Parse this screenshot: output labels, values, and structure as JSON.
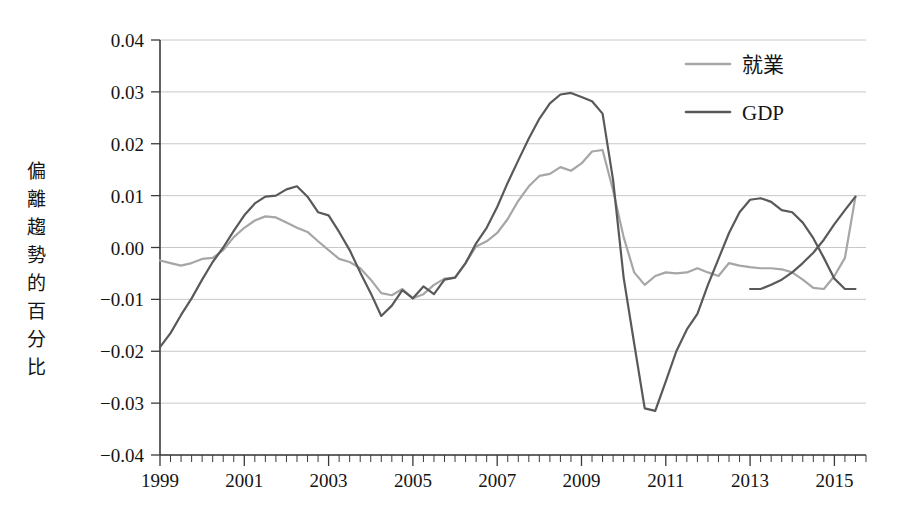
{
  "chart_data": {
    "type": "line",
    "title": "",
    "subtitle": "",
    "xlabel": "",
    "ylabel": "偏離趨勢的百分比",
    "ylabel_chars": [
      "偏",
      "離",
      "趨",
      "勢",
      "的",
      "百",
      "分",
      "比"
    ],
    "xlim": [
      1999.0,
      2015.75
    ],
    "ylim": [
      -0.04,
      0.04
    ],
    "grid": true,
    "grid_axis": "y",
    "legend_position": "top-right",
    "y_ticks": [
      0.04,
      0.03,
      0.02,
      0.01,
      0.0,
      -0.01,
      -0.02,
      -0.03,
      -0.04
    ],
    "y_tick_labels": [
      "0.04",
      "0.03",
      "0.02",
      "0.01",
      "0.00",
      "−0.01",
      "−0.02",
      "−0.03",
      "−0.04"
    ],
    "x_ticks": [
      1999,
      2001,
      2003,
      2005,
      2007,
      2009,
      2011,
      2013,
      2015
    ],
    "x_tick_labels": [
      "1999",
      "2001",
      "2003",
      "2005",
      "2007",
      "2009",
      "2011",
      "2013",
      "2015"
    ],
    "x_minor_interval": 0.25,
    "colors": {
      "employment": "#a6a6a6",
      "gdp": "#595959",
      "grid": "#c8c8c8",
      "axis": "#3a3a3a",
      "text": "#141414",
      "background": "#ffffff"
    },
    "x": [
      1999.0,
      1999.25,
      1999.5,
      1999.75,
      2000.0,
      2000.25,
      2000.5,
      2000.75,
      2001.0,
      2001.25,
      2001.5,
      2001.75,
      2002.0,
      2002.25,
      2002.5,
      2002.75,
      2003.0,
      2003.25,
      2003.5,
      2003.75,
      2004.0,
      2004.25,
      2004.5,
      2004.75,
      2005.0,
      2005.25,
      2005.5,
      2005.75,
      2006.0,
      2006.25,
      2006.5,
      2006.75,
      2007.0,
      2007.25,
      2007.5,
      2007.75,
      2008.0,
      2008.25,
      2008.5,
      2008.75,
      2009.0,
      2009.25,
      2009.5,
      2009.75,
      2010.0,
      2010.25,
      2010.5,
      2010.75,
      2011.0,
      2011.25,
      2011.5,
      2011.75,
      2012.0,
      2012.25,
      2012.5,
      2012.75,
      2013.0,
      2013.25,
      2013.5,
      2013.75,
      2014.0,
      2014.25,
      2014.5,
      2014.75,
      2015.0,
      2015.25,
      2015.5
    ],
    "series": [
      {
        "name": "就業",
        "key": "employment",
        "color": "#a6a6a6",
        "linewidth": 2.2,
        "values": [
          -0.0025,
          -0.003,
          -0.0035,
          -0.003,
          -0.0022,
          -0.002,
          -0.0005,
          0.002,
          0.0038,
          0.0052,
          0.006,
          0.0058,
          0.0048,
          0.0038,
          0.003,
          0.0012,
          -0.0005,
          -0.0022,
          -0.0028,
          -0.004,
          -0.0062,
          -0.0088,
          -0.0092,
          -0.008,
          -0.0098,
          -0.009,
          -0.0072,
          -0.006,
          -0.0058,
          -0.003,
          0.0002,
          0.0012,
          0.0028,
          0.0055,
          0.009,
          0.0118,
          0.0138,
          0.0142,
          0.0155,
          0.0148,
          0.0162,
          0.0185,
          0.0188,
          0.011,
          0.002,
          -0.0048,
          -0.0072,
          -0.0055,
          -0.0048,
          -0.005,
          -0.0048,
          -0.004,
          -0.0048,
          -0.0055,
          -0.003,
          -0.0035,
          -0.0038,
          -0.004,
          -0.004,
          -0.0042,
          -0.0048,
          -0.0062,
          -0.0078,
          -0.008,
          -0.0055,
          -0.002,
          0.0098
        ]
      },
      {
        "name": "GDP",
        "key": "gdp",
        "color": "#595959",
        "linewidth": 2.2,
        "values": [
          -0.0192,
          -0.0165,
          -0.013,
          -0.0098,
          -0.0062,
          -0.0028,
          0.0,
          0.0032,
          0.0062,
          0.0085,
          0.0098,
          0.01,
          0.0112,
          0.0118,
          0.0098,
          0.0068,
          0.0062,
          0.003,
          -0.0005,
          -0.0048,
          -0.0088,
          -0.0132,
          -0.0112,
          -0.0082,
          -0.0098,
          -0.0075,
          -0.009,
          -0.0062,
          -0.0058,
          -0.003,
          0.0008,
          0.0038,
          0.0078,
          0.0125,
          0.0168,
          0.021,
          0.0248,
          0.0278,
          0.0295,
          0.0298,
          0.029,
          0.0282,
          0.0258,
          0.013,
          -0.0058,
          -0.0185,
          -0.031,
          -0.0315,
          -0.0258,
          -0.02,
          -0.0158,
          -0.0128,
          -0.0072,
          -0.0022,
          0.0028,
          0.0068,
          0.0092,
          0.0095,
          0.0088,
          0.0072,
          0.0068,
          0.0048,
          0.0018,
          -0.002,
          -0.006,
          -0.008,
          -0.008
        ]
      }
    ],
    "gdp_tail": {
      "x": [
        2013.0,
        2013.25,
        2013.5,
        2013.75,
        2014.0,
        2014.25,
        2014.5,
        2014.75,
        2015.0,
        2015.25,
        2015.5
      ],
      "values": [
        -0.008,
        -0.008,
        -0.0072,
        -0.0062,
        -0.0048,
        -0.003,
        -0.001,
        0.0015,
        0.0045,
        0.0072,
        0.0098
      ]
    }
  },
  "legend": {
    "items": [
      {
        "label": "就業",
        "color": "#a6a6a6"
      },
      {
        "label": "GDP",
        "color": "#595959"
      }
    ]
  }
}
